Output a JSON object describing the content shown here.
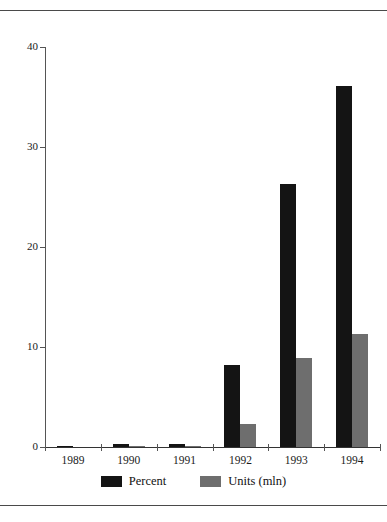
{
  "chart_data": {
    "type": "bar",
    "title": "",
    "xlabel": "",
    "ylabel": "",
    "categories": [
      "1989",
      "1990",
      "1991",
      "1992",
      "1993",
      "1994"
    ],
    "series": [
      {
        "name": "Percent",
        "color": "#141414",
        "values": [
          0.1,
          0.3,
          0.3,
          8.2,
          26.3,
          36.1
        ]
      },
      {
        "name": "Units (mln)",
        "color": "#6e6e6e",
        "values": [
          0.0,
          0.1,
          0.1,
          2.3,
          8.9,
          11.3
        ]
      }
    ],
    "ylim": [
      0,
      40
    ],
    "yticks": [
      0,
      10,
      20,
      30,
      40
    ],
    "ytick_labels": [
      "0",
      "10",
      "20",
      "30",
      "40"
    ],
    "grid": false,
    "legend_position": "bottom"
  },
  "legend": {
    "entries": [
      {
        "label": "Percent",
        "swatch": "black-swatch-icon"
      },
      {
        "label": "Units (mln)",
        "swatch": "gray-swatch-icon"
      }
    ]
  }
}
